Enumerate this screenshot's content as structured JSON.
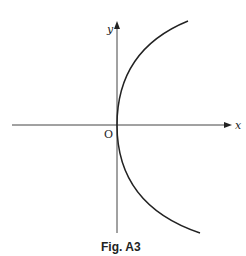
{
  "figure": {
    "caption": "Fig. A3",
    "x_axis_label": "x",
    "y_axis_label": "y",
    "origin_label": "O",
    "curve": "parabola opening in +x direction, vertex at origin (y^2 = kx)",
    "colors": {
      "line": "#222222",
      "axis": "#444444",
      "background": "#ffffff"
    }
  }
}
